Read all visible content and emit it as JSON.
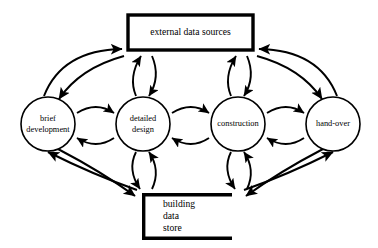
{
  "canvas": {
    "width": 378,
    "height": 248,
    "background": "#ffffff",
    "stroke_color": "#000000"
  },
  "diagram": {
    "type": "flow-diagram",
    "title": "",
    "process_nodes": [
      {
        "id": "brief-development",
        "shape": "circle",
        "label_lines": [
          "brief",
          "development"
        ],
        "cx": 48,
        "cy": 124,
        "r": 27
      },
      {
        "id": "detailed-design",
        "shape": "circle",
        "label_lines": [
          "detailed",
          "design"
        ],
        "cx": 143,
        "cy": 124,
        "r": 27
      },
      {
        "id": "construction",
        "shape": "circle",
        "label_lines": [
          "construction"
        ],
        "cx": 238,
        "cy": 124,
        "r": 27
      },
      {
        "id": "hand-over",
        "shape": "circle",
        "label_lines": [
          "hand-over"
        ],
        "cx": 333,
        "cy": 124,
        "r": 27
      }
    ],
    "data_nodes": [
      {
        "id": "external-data-sources",
        "shape": "rectangle",
        "label": "external data sources",
        "x": 128,
        "y": 15,
        "width": 125,
        "height": 35
      },
      {
        "id": "building-data-store",
        "shape": "open-ended-store",
        "label_lines": [
          "building",
          "data",
          "store"
        ],
        "x": 142,
        "y": 193,
        "width": 90,
        "height": 47
      }
    ],
    "connections": [
      {
        "from": "brief-development",
        "to": "detailed-design",
        "direction": "bidirectional"
      },
      {
        "from": "detailed-design",
        "to": "construction",
        "direction": "bidirectional"
      },
      {
        "from": "construction",
        "to": "hand-over",
        "direction": "bidirectional"
      },
      {
        "from": "detailed-design",
        "to": "external-data-sources",
        "direction": "bidirectional"
      },
      {
        "from": "construction",
        "to": "external-data-sources",
        "direction": "bidirectional"
      },
      {
        "from": "brief-development",
        "to": "external-data-sources",
        "direction": "bidirectional"
      },
      {
        "from": "hand-over",
        "to": "external-data-sources",
        "direction": "bidirectional"
      },
      {
        "from": "detailed-design",
        "to": "building-data-store",
        "direction": "bidirectional"
      },
      {
        "from": "construction",
        "to": "building-data-store",
        "direction": "bidirectional"
      },
      {
        "from": "brief-development",
        "to": "building-data-store",
        "direction": "bidirectional"
      },
      {
        "from": "hand-over",
        "to": "building-data-store",
        "direction": "bidirectional"
      }
    ]
  }
}
